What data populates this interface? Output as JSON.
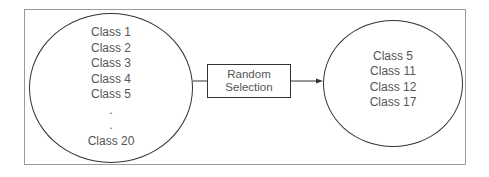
{
  "diagram": {
    "type": "flow",
    "left_set": {
      "items": [
        "Class 1",
        "Class 2",
        "Class 3",
        "Class 4",
        "Class 5",
        ".",
        ".",
        "Class 20"
      ]
    },
    "process": {
      "line1": "Random",
      "line2": "Selection"
    },
    "right_set": {
      "items": [
        "Class 5",
        "Class 11",
        "Class 12",
        "Class 17"
      ]
    },
    "colors": {
      "stroke": "#333333",
      "text": "#555555",
      "frame": "#9a9a9a"
    }
  }
}
